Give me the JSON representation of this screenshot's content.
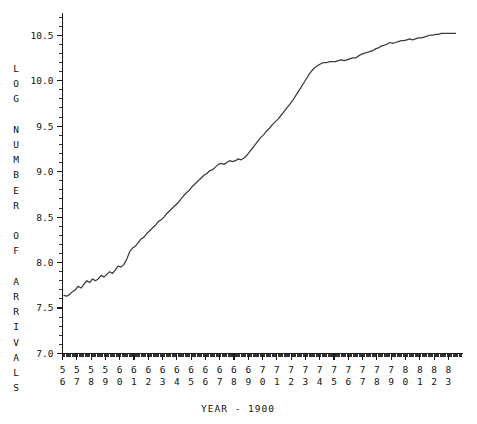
{
  "chart_data": {
    "type": "line",
    "title": "",
    "xlabel": "YEAR - 1900",
    "ylabel": "LOG NUMBER OF ARRIVALS",
    "ylabel_letters": [
      "L",
      "O",
      "G",
      "",
      "N",
      "U",
      "M",
      "B",
      "E",
      "R",
      "",
      "O",
      "F",
      "",
      "A",
      "R",
      "R",
      "I",
      "V",
      "A",
      "L",
      "S"
    ],
    "xlim": [
      56,
      83.99
    ],
    "ylim": [
      7.0,
      10.75
    ],
    "ytick_labels": [
      "7.0",
      "7.5",
      "8.0",
      "8.5",
      "9.0",
      "9.5",
      "10.0",
      "10.5"
    ],
    "ytick_values": [
      7.0,
      7.5,
      8.0,
      8.5,
      9.0,
      9.5,
      10.0,
      10.5
    ],
    "yminor_step": 0.1,
    "xtick_labels_top": [
      "5",
      "5",
      "5",
      "5",
      "6",
      "6",
      "6",
      "6",
      "6",
      "6",
      "6",
      "6",
      "6",
      "6",
      "7",
      "7",
      "7",
      "7",
      "7",
      "7",
      "7",
      "7",
      "7",
      "7",
      "8",
      "8",
      "8",
      "8"
    ],
    "xtick_labels_bottom": [
      "6",
      "7",
      "8",
      "9",
      "0",
      "1",
      "2",
      "3",
      "4",
      "5",
      "6",
      "7",
      "8",
      "9",
      "0",
      "1",
      "2",
      "3",
      "4",
      "5",
      "6",
      "7",
      "8",
      "9",
      "0",
      "1",
      "2",
      "3"
    ],
    "xtick_values": [
      56,
      57,
      58,
      59,
      60,
      61,
      62,
      63,
      64,
      65,
      66,
      67,
      68,
      69,
      70,
      71,
      72,
      73,
      74,
      75,
      76,
      77,
      78,
      79,
      80,
      81,
      82,
      83
    ],
    "xminor_per_major": 12,
    "grid": false,
    "legend": null,
    "line_color": "#3b3b44",
    "axis_color": "#1a1a1a",
    "background_color": "#ffffff",
    "series": [
      {
        "name": "log number of arrivals",
        "x": [
          56.1,
          56.3,
          56.5,
          56.7,
          56.9,
          57.1,
          57.3,
          57.5,
          57.7,
          57.9,
          58.1,
          58.3,
          58.5,
          58.7,
          58.9,
          59.1,
          59.3,
          59.5,
          59.7,
          59.9,
          60.1,
          60.3,
          60.5,
          60.7,
          60.9,
          61.1,
          61.3,
          61.5,
          61.7,
          61.9,
          62.1,
          62.3,
          62.5,
          62.7,
          62.9,
          63.1,
          63.3,
          63.5,
          63.7,
          63.9,
          64.1,
          64.3,
          64.5,
          64.7,
          64.9,
          65.1,
          65.3,
          65.5,
          65.7,
          65.9,
          66.1,
          66.3,
          66.5,
          66.7,
          66.9,
          67.1,
          67.3,
          67.5,
          67.7,
          67.9,
          68.1,
          68.3,
          68.5,
          68.7,
          68.9,
          69.1,
          69.3,
          69.5,
          69.7,
          69.9,
          70.1,
          70.3,
          70.5,
          70.7,
          70.9,
          71.1,
          71.3,
          71.5,
          71.7,
          71.9,
          72.1,
          72.3,
          72.5,
          72.7,
          72.9,
          73.1,
          73.3,
          73.5,
          73.7,
          73.9,
          74.1,
          74.3,
          74.5,
          74.7,
          74.9,
          75.1,
          75.3,
          75.5,
          75.7,
          75.9,
          76.1,
          76.3,
          76.5,
          76.7,
          76.9,
          77.1,
          77.3,
          77.5,
          77.7,
          77.9,
          78.1,
          78.3,
          78.5,
          78.7,
          78.9,
          79.1,
          79.3,
          79.5,
          79.7,
          79.9,
          80.1,
          80.3,
          80.5,
          80.7,
          80.9,
          81.1,
          81.3,
          81.5,
          81.7,
          81.9,
          82.1,
          82.3,
          82.5,
          82.7,
          82.9,
          83.1,
          83.3,
          83.5
        ],
        "y": [
          7.64,
          7.63,
          7.65,
          7.68,
          7.7,
          7.74,
          7.72,
          7.76,
          7.8,
          7.78,
          7.82,
          7.8,
          7.82,
          7.86,
          7.84,
          7.87,
          7.9,
          7.88,
          7.92,
          7.96,
          7.95,
          7.98,
          8.04,
          8.12,
          8.16,
          8.18,
          8.22,
          8.26,
          8.28,
          8.32,
          8.35,
          8.38,
          8.41,
          8.45,
          8.47,
          8.5,
          8.54,
          8.57,
          8.6,
          8.63,
          8.66,
          8.7,
          8.74,
          8.77,
          8.8,
          8.84,
          8.87,
          8.9,
          8.93,
          8.96,
          8.98,
          9.01,
          9.02,
          9.05,
          9.08,
          9.09,
          9.08,
          9.1,
          9.12,
          9.11,
          9.12,
          9.14,
          9.13,
          9.15,
          9.18,
          9.22,
          9.26,
          9.3,
          9.34,
          9.38,
          9.41,
          9.45,
          9.48,
          9.52,
          9.55,
          9.58,
          9.62,
          9.66,
          9.7,
          9.74,
          9.78,
          9.83,
          9.88,
          9.93,
          9.98,
          10.03,
          10.08,
          10.12,
          10.15,
          10.17,
          10.19,
          10.2,
          10.2,
          10.21,
          10.21,
          10.21,
          10.22,
          10.23,
          10.22,
          10.23,
          10.24,
          10.25,
          10.25,
          10.27,
          10.29,
          10.3,
          10.31,
          10.32,
          10.33,
          10.35,
          10.36,
          10.38,
          10.39,
          10.4,
          10.42,
          10.41,
          10.42,
          10.43,
          10.44,
          10.44,
          10.45,
          10.46,
          10.45,
          10.46,
          10.47,
          10.47,
          10.48,
          10.49,
          10.5,
          10.5,
          10.51,
          10.51,
          10.52,
          10.52,
          10.52,
          10.52,
          10.52,
          10.52
        ]
      }
    ]
  }
}
